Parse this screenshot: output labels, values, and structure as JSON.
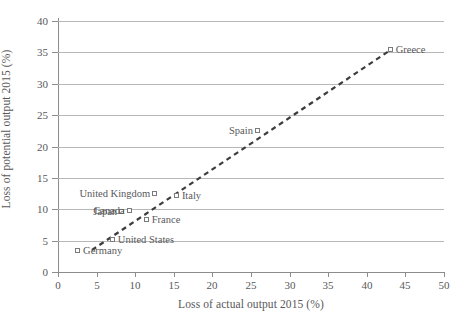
{
  "chart_data": {
    "type": "scatter",
    "title": "",
    "xlabel": "Loss of actual output 2015 (%)",
    "ylabel": "Loss of potential output 2015 (%)",
    "xlim": [
      0,
      50
    ],
    "ylim": [
      0,
      40
    ],
    "xticks": [
      "0",
      "5",
      "10",
      "15",
      "20",
      "25",
      "30",
      "35",
      "40",
      "45",
      "50"
    ],
    "yticks": [
      "0",
      "5",
      "10",
      "15",
      "20",
      "25",
      "30",
      "35",
      "40"
    ],
    "grid": "horizontal",
    "legend": "none",
    "marker_style": "open-square",
    "points": [
      {
        "name": "Germany",
        "x": 2.6,
        "y": 3.3,
        "label_side": "right"
      },
      {
        "name": "United States",
        "x": 7.1,
        "y": 5.1,
        "label_side": "right"
      },
      {
        "name": "Japan",
        "x": 8.3,
        "y": 9.6,
        "label_side": "left"
      },
      {
        "name": "Canada",
        "x": 9.3,
        "y": 9.8,
        "label_side": "left"
      },
      {
        "name": "France",
        "x": 11.5,
        "y": 8.3,
        "label_side": "right"
      },
      {
        "name": "United Kingdom",
        "x": 12.6,
        "y": 12.4,
        "label_side": "left"
      },
      {
        "name": "Italy",
        "x": 15.4,
        "y": 12.1,
        "label_side": "right"
      },
      {
        "name": "Spain",
        "x": 25.9,
        "y": 22.5,
        "label_side": "left"
      },
      {
        "name": "Greece",
        "x": 43.1,
        "y": 35.4,
        "label_side": "right"
      }
    ],
    "trend_line": {
      "style": "dashed",
      "color": "#3c3c3e",
      "x0": 4.4,
      "y0": 3.5,
      "x1": 43.1,
      "y1": 35.4
    },
    "colors": {
      "gridline": "#b7b7b9",
      "axis": "#8d8d8f",
      "text": "#58585a",
      "marker_border": "#7b7b7d",
      "background": "#ffffff"
    }
  }
}
